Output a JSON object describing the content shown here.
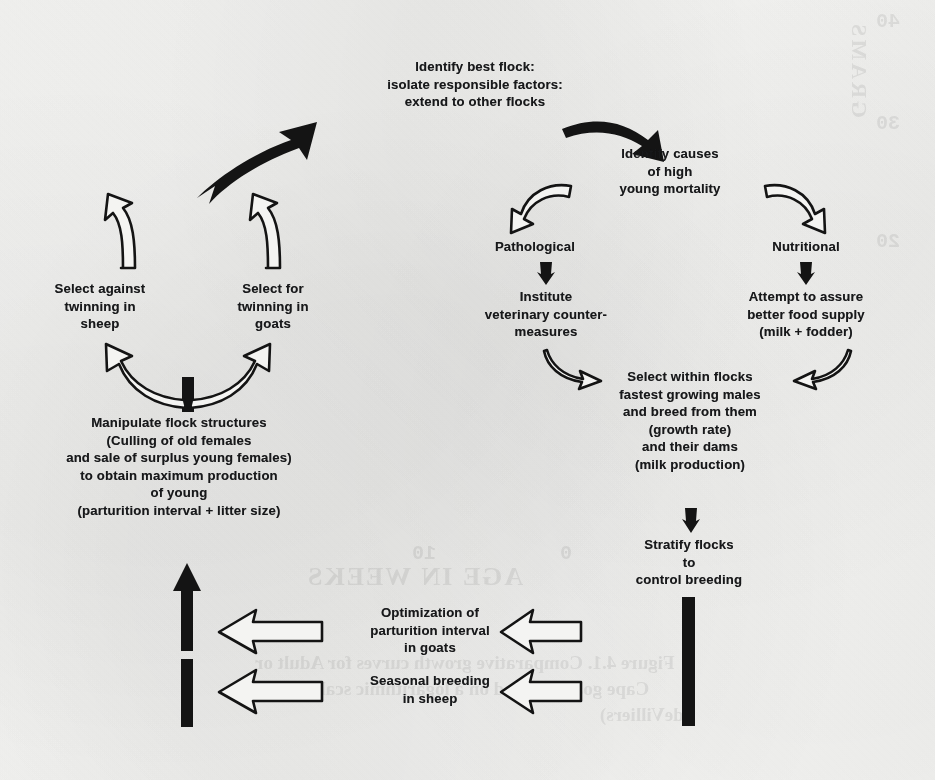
{
  "figure": {
    "type": "cycle-flow-diagram",
    "background_color": "#f4f4f2",
    "ink_color": "#141414"
  },
  "nodes": {
    "identify_best_flock": "Identify best flock:\nisolate responsible factors:\nextend to other flocks",
    "identify_causes": "Identify causes\nof high\nyoung mortality",
    "pathological": "Pathological",
    "nutritional": "Nutritional",
    "institute_vet": "Institute\nveterinary counter-\nmeasures",
    "attempt_food": "Attempt to assure\nbetter food supply\n(milk + fodder)",
    "select_within_flocks": "Select within flocks\nfastest growing males\nand breed from them\n(growth rate)\nand their dams\n(milk production)",
    "stratify_flocks": "Stratify flocks\nto\ncontrol breeding",
    "optimization_goats": "Optimization of\nparturition interval\nin goats",
    "seasonal_sheep": "Seasonal breeding\nin sheep",
    "manipulate_flock": "Manipulate flock structures\n(Culling of old females\nand sale of surplus young females)\nto obtain maximum production\nof young\n(parturition interval + litter size)",
    "select_against_sheep": "Select against\ntwinning in\nsheep",
    "select_for_goats": "Select for\ntwinning in\ngoats"
  },
  "connectors": [
    {
      "id": "arrow-best-flock-to-causes",
      "style": "solid-black-curved",
      "from": "identify_best_flock",
      "to": "identify_causes"
    },
    {
      "id": "arrow-causes-to-pathological",
      "style": "hollow-curved",
      "from": "identify_causes",
      "to": "pathological"
    },
    {
      "id": "arrow-causes-to-nutritional",
      "style": "hollow-curved",
      "from": "identify_causes",
      "to": "nutritional"
    },
    {
      "id": "arrow-pathological-to-institute",
      "style": "solid-short-down",
      "from": "pathological",
      "to": "institute_vet"
    },
    {
      "id": "arrow-nutritional-to-attempt",
      "style": "solid-short-down",
      "from": "nutritional",
      "to": "attempt_food"
    },
    {
      "id": "arrow-institute-to-select",
      "style": "hollow-curved",
      "from": "institute_vet",
      "to": "select_within_flocks"
    },
    {
      "id": "arrow-attempt-to-select",
      "style": "hollow-curved",
      "from": "attempt_food",
      "to": "select_within_flocks"
    },
    {
      "id": "arrow-select-to-stratify",
      "style": "solid-short-down",
      "from": "select_within_flocks",
      "to": "stratify_flocks"
    },
    {
      "id": "bar-stratify-down",
      "style": "solid-bar",
      "from": "stratify_flocks",
      "to": "optimization_goats"
    },
    {
      "id": "arrow-to-optimization-goats",
      "style": "hollow-left",
      "from": "stratify_flocks",
      "to": "optimization_goats"
    },
    {
      "id": "arrow-to-seasonal-sheep",
      "style": "hollow-left",
      "from": "stratify_flocks",
      "to": "seasonal_sheep"
    },
    {
      "id": "arrow-optimization-out",
      "style": "hollow-left",
      "from": "optimization_goats",
      "to": "manipulate_flock"
    },
    {
      "id": "arrow-seasonal-out",
      "style": "hollow-left",
      "from": "seasonal_sheep",
      "to": "manipulate_flock"
    },
    {
      "id": "arrow-up-to-manipulate",
      "style": "solid-bar-arrow-up",
      "from": "seasonal_sheep",
      "to": "manipulate_flock"
    },
    {
      "id": "bar-manipulate-up",
      "style": "solid-bar",
      "from": "manipulate_flock",
      "to": "twinning-split"
    },
    {
      "id": "arrow-manipulate-to-sheep",
      "style": "hollow-curved",
      "from": "manipulate_flock",
      "to": "select_against_sheep"
    },
    {
      "id": "arrow-manipulate-to-goats",
      "style": "hollow-curved",
      "from": "manipulate_flock",
      "to": "select_for_goats"
    },
    {
      "id": "arrow-sheep-up",
      "style": "hollow-curved-up",
      "from": "select_against_sheep",
      "to": "identify_best_flock"
    },
    {
      "id": "arrow-goats-up",
      "style": "hollow-curved-up",
      "from": "select_for_goats",
      "to": "identify_best_flock"
    }
  ],
  "bleed_through": {
    "note": "Faint mirrored text showing through from the reverse side of the page",
    "items": [
      {
        "text": "GRAMS",
        "orientation": "vertical-mirrored"
      },
      {
        "text": "40",
        "orientation": "mirrored"
      },
      {
        "text": "30",
        "orientation": "mirrored"
      },
      {
        "text": "20",
        "orientation": "mirrored"
      },
      {
        "text": "10",
        "orientation": "mirrored"
      },
      {
        "text": "0",
        "orientation": "mirrored"
      },
      {
        "text": "AGE IN WEEKS",
        "orientation": "mirrored"
      },
      {
        "text": "Figure 4.1. Comparative growth curves for Adult or",
        "orientation": "mirrored"
      },
      {
        "text": "Cape goats, plotted on a logarithmic scale (after",
        "orientation": "mirrored"
      },
      {
        "text": "deVilliers)",
        "orientation": "mirrored"
      }
    ]
  }
}
